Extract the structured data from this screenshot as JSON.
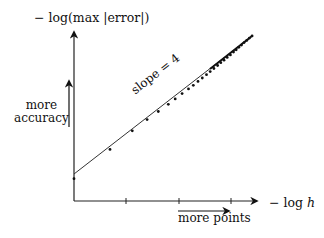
{
  "chart_data": {
    "type": "scatter",
    "title": "",
    "xlabel": "− log h",
    "ylabel": "− log(max |error|)",
    "x_ticks": [
      "",
      "",
      ""
    ],
    "y_ticks": [],
    "grid": false,
    "legend": null,
    "annotations": [
      {
        "text": "slope = 4",
        "kind": "line-label"
      },
      {
        "text": "more accuracy",
        "kind": "arrow-up-annotation"
      },
      {
        "text": "more points",
        "kind": "arrow-right-annotation"
      }
    ],
    "series": [
      {
        "name": "computed errors",
        "style": "dots",
        "x": [
          0.0,
          0.68,
          1.1,
          1.38,
          1.59,
          1.78,
          1.91,
          2.04,
          2.16,
          2.25,
          2.34,
          2.42,
          2.5,
          2.57,
          2.64,
          2.71,
          2.77,
          2.83,
          2.89,
          2.95,
          3.01,
          3.06,
          3.11,
          3.16,
          3.21,
          3.26,
          3.31,
          3.36
        ],
        "y": [
          -0.17,
          0.88,
          1.55,
          1.95,
          2.24,
          2.5,
          2.69,
          2.88,
          3.05,
          3.18,
          3.32,
          3.44,
          3.56,
          3.67,
          3.78,
          3.89,
          3.99,
          4.08,
          4.18,
          4.27,
          4.37,
          4.45,
          4.54,
          4.62,
          4.71,
          4.79,
          4.87,
          4.95
        ]
      },
      {
        "name": "fitted line",
        "style": "line",
        "x": [
          0.0,
          3.36
        ],
        "y": [
          0.0,
          4.95
        ],
        "slope_label": "slope = 4"
      }
    ],
    "axis_ranges": {
      "x": [
        0,
        3.5
      ],
      "y": [
        -0.5,
        5.5
      ]
    },
    "units_note": "x in units of axis-tick spacing; y relative to line intercept"
  },
  "labels": {
    "y_axis_prefix": "− log(max |error|)",
    "x_axis_prefix": "− log ",
    "x_axis_var": "h",
    "more": "more",
    "accuracy": "accuracy",
    "more_points": "more points",
    "slope": "slope = 4"
  }
}
